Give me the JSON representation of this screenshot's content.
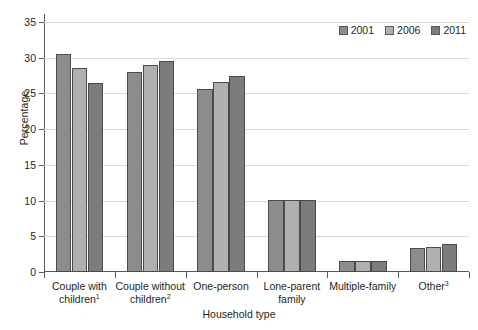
{
  "chart_data": {
    "type": "bar",
    "title": "",
    "xlabel": "Household type",
    "ylabel": "Percentage",
    "ylim": [
      0,
      35
    ],
    "yticks": [
      0,
      5,
      10,
      15,
      20,
      25,
      30,
      35
    ],
    "grid": true,
    "legend_position": "top-right",
    "categories": [
      "Couple with children¹",
      "Couple without children²",
      "One-person",
      "Lone-parent family",
      "Multiple-family",
      "Other³"
    ],
    "series": [
      {
        "name": "2001",
        "values": [
          30.5,
          28.0,
          25.6,
          10.1,
          1.5,
          3.3
        ]
      },
      {
        "name": "2006",
        "values": [
          28.5,
          29.0,
          26.6,
          10.1,
          1.6,
          3.5
        ]
      },
      {
        "name": "2011",
        "values": [
          26.5,
          29.5,
          27.4,
          10.1,
          1.6,
          3.9
        ]
      }
    ],
    "colors": [
      "#8c8c8c",
      "#b0b0b0",
      "#7c7c7c"
    ]
  },
  "axis": {
    "y_title": "Percentage",
    "x_title": "Household type",
    "y_tick_labels": [
      "0",
      "5",
      "10",
      "15",
      "20",
      "25",
      "30",
      "35"
    ]
  },
  "legend": {
    "entries": [
      {
        "label": "2001",
        "color": "#8c8c8c"
      },
      {
        "label": "2006",
        "color": "#b0b0b0"
      },
      {
        "label": "2011",
        "color": "#7c7c7c"
      }
    ]
  },
  "x_labels": [
    {
      "line1": "Couple with",
      "line2": "children",
      "footnote": "1"
    },
    {
      "line1": "Couple without",
      "line2": "children",
      "footnote": "2"
    },
    {
      "line1": "One-person",
      "line2": "",
      "footnote": ""
    },
    {
      "line1": "Lone-parent",
      "line2": "family",
      "footnote": ""
    },
    {
      "line1": "Multiple-family",
      "line2": "",
      "footnote": ""
    },
    {
      "line1": "Other",
      "line2": "",
      "footnote": "3"
    }
  ]
}
